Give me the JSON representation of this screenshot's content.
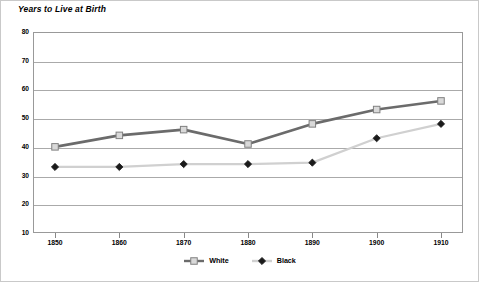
{
  "chart_data": {
    "type": "line",
    "title": "Years to Live at Birth",
    "xlabel": "",
    "ylabel": "",
    "x": [
      1850,
      1860,
      1870,
      1880,
      1890,
      1900,
      1910
    ],
    "categories": [
      "1850",
      "1860",
      "1870",
      "1880",
      "1890",
      "1900",
      "1910"
    ],
    "series": [
      {
        "name": "White",
        "values": [
          40,
          44,
          46,
          41,
          48,
          53,
          56
        ],
        "line_color": "#6b6b6b",
        "marker": "square",
        "marker_fill": "#d9d9d9",
        "marker_stroke": "#808080"
      },
      {
        "name": "Black",
        "values": [
          33,
          33,
          34,
          34,
          34.5,
          43,
          48
        ],
        "line_color": "#d0d0d0",
        "marker": "diamond",
        "marker_fill": "#1a1a1a",
        "marker_stroke": "#1a1a1a"
      }
    ],
    "ylim": [
      10,
      80
    ],
    "yticks": [
      10,
      20,
      30,
      40,
      50,
      60,
      70,
      80
    ],
    "ytick_labels": [
      "10",
      "20",
      "30",
      "40",
      "50",
      "60",
      "70",
      "80"
    ],
    "xlim": [
      1850,
      1910
    ],
    "grid": true,
    "grid_color": "#aaaaaa",
    "legend_position": "bottom-center",
    "legend_entries": [
      "White",
      "Black"
    ],
    "plot_border_color": "#999999",
    "background": "#ffffff"
  }
}
